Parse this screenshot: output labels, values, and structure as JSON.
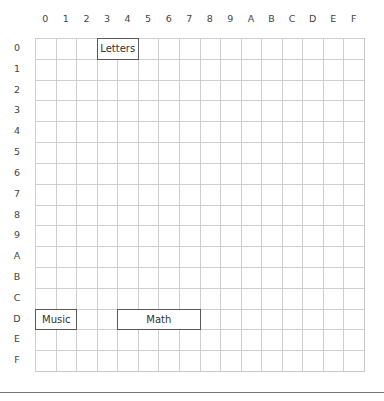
{
  "grid": {
    "columns": [
      "0",
      "1",
      "2",
      "3",
      "4",
      "5",
      "6",
      "7",
      "8",
      "9",
      "A",
      "B",
      "C",
      "D",
      "E",
      "F"
    ],
    "rows": [
      "0",
      "1",
      "2",
      "3",
      "4",
      "5",
      "6",
      "7",
      "8",
      "9",
      "A",
      "B",
      "C",
      "D",
      "E",
      "F"
    ],
    "colors": {
      "gridline": "#cfcfcf",
      "block_border": "#5a5a5a",
      "label": "#444444"
    }
  },
  "blocks": [
    {
      "label": "Letters",
      "row": "0",
      "col_start": "3",
      "col_end": "4",
      "align": "center"
    },
    {
      "label": "Music",
      "row": "D",
      "col_start": "0",
      "col_end": "1",
      "align": "left"
    },
    {
      "label": "Math",
      "row": "D",
      "col_start": "4",
      "col_end": "7",
      "align": "center"
    }
  ],
  "footer": {
    "text": ""
  }
}
